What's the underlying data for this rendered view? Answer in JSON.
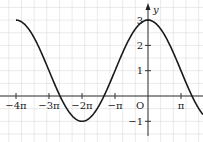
{
  "chart_data": {
    "type": "line",
    "title": "",
    "function": "y = 1 + 2cos(x/2)",
    "xlabel": "",
    "ylabel": "y",
    "origin_label": "O",
    "x_ticks": [
      {
        "value": -12.566,
        "label": "−4π"
      },
      {
        "value": -9.425,
        "label": "−3π"
      },
      {
        "value": -6.283,
        "label": "−2π"
      },
      {
        "value": -3.1416,
        "label": "−π"
      },
      {
        "value": 3.1416,
        "label": "π"
      }
    ],
    "y_ticks": [
      {
        "value": -1,
        "label": "−1"
      },
      {
        "value": 1,
        "label": "1"
      },
      {
        "value": 2,
        "label": "2"
      },
      {
        "value": 3,
        "label": "3"
      }
    ],
    "xlim": [
      -13.0,
      5.2
    ],
    "ylim": [
      -1.8,
      3.8
    ],
    "grid": true,
    "series": [
      {
        "name": "curve",
        "x": [
          -12.566,
          -9.425,
          -8.378,
          -6.283,
          -4.189,
          -3.1416,
          0,
          3.1416,
          4.189,
          5.2
        ],
        "y": [
          3,
          1,
          0,
          -1,
          0,
          1,
          3,
          1,
          0,
          -0.4
        ]
      }
    ]
  }
}
